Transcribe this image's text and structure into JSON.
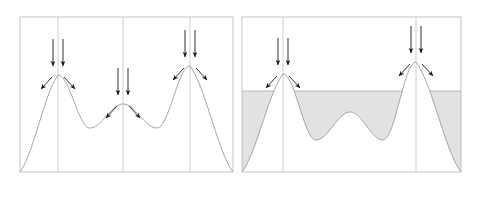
{
  "figure": {
    "title": "",
    "type": "two-panel-schematic",
    "width": 477,
    "height": 199,
    "background_color": "#ffffff"
  },
  "style": {
    "curve_color": "#9a9a9a",
    "curve_width": 0.9,
    "frame_color": "#b4b4b4",
    "frame_width": 0.8,
    "gridline_color": "#c0c0c0",
    "gridline_width": 0.8,
    "arrow_color": "#1a1a1a",
    "arrow_width": 0.9,
    "fill_color": "#e2e2e2",
    "fill_edge_color": "#a8a8a8"
  },
  "panels": [
    {
      "id": "left-panel",
      "name": "unfilled-potential-landscape",
      "frame": {
        "x": 20,
        "y": 17,
        "width": 213,
        "height": 155
      },
      "gridlines_x": [
        58,
        123,
        190
      ],
      "water_level": null,
      "curve": {
        "label": "energy-landscape-curve",
        "peaks": [
          {
            "x": 58,
            "y": 75
          },
          {
            "x": 123,
            "y": 104
          },
          {
            "x": 190,
            "y": 66
          }
        ],
        "valleys": [
          {
            "x": 90,
            "y": 128
          },
          {
            "x": 157,
            "y": 128
          }
        ],
        "endpoints": [
          {
            "x": 20,
            "y": 172
          },
          {
            "x": 233,
            "y": 172
          }
        ]
      },
      "arrow_groups": [
        {
          "name": "arrow-group-peak-1",
          "apex": {
            "x": 58,
            "y": 75
          },
          "down_arrows": [
            {
              "x": 53,
              "y_start": 39,
              "y_end": 66
            },
            {
              "x": 63,
              "y_start": 39,
              "y_end": 66
            }
          ],
          "split_arrows": [
            {
              "x_start": 52,
              "y_start": 77,
              "x_end": 41,
              "y_end": 89
            },
            {
              "x_start": 64,
              "y_start": 77,
              "x_end": 75,
              "y_end": 89
            }
          ]
        },
        {
          "name": "arrow-group-peak-2",
          "apex": {
            "x": 123,
            "y": 104
          },
          "down_arrows": [
            {
              "x": 118,
              "y_start": 68,
              "y_end": 95
            },
            {
              "x": 128,
              "y_start": 68,
              "y_end": 95
            }
          ],
          "split_arrows": [
            {
              "x_start": 117,
              "y_start": 106,
              "x_end": 106,
              "y_end": 118
            },
            {
              "x_start": 129,
              "y_start": 106,
              "x_end": 140,
              "y_end": 118
            }
          ]
        },
        {
          "name": "arrow-group-peak-3",
          "apex": {
            "x": 190,
            "y": 66
          },
          "down_arrows": [
            {
              "x": 185,
              "y_start": 30,
              "y_end": 57
            },
            {
              "x": 195,
              "y_start": 30,
              "y_end": 57
            }
          ],
          "split_arrows": [
            {
              "x_start": 184,
              "y_start": 68,
              "x_end": 173,
              "y_end": 80
            },
            {
              "x_start": 196,
              "y_start": 68,
              "x_end": 207,
              "y_end": 80
            }
          ]
        }
      ]
    },
    {
      "id": "right-panel",
      "name": "filled-potential-landscape",
      "frame": {
        "x": 242,
        "y": 17,
        "width": 219,
        "height": 155
      },
      "gridlines_x": [
        283,
        416
      ],
      "water_level": {
        "y": 91,
        "label": "fill-level-line"
      },
      "curve": {
        "label": "energy-landscape-curve",
        "peaks": [
          {
            "x": 283,
            "y": 74
          },
          {
            "x": 350,
            "y": 112
          },
          {
            "x": 416,
            "y": 62
          }
        ],
        "valleys": [
          {
            "x": 316,
            "y": 140
          },
          {
            "x": 383,
            "y": 140
          }
        ],
        "endpoints": [
          {
            "x": 242,
            "y": 172
          },
          {
            "x": 461,
            "y": 172
          }
        ]
      },
      "arrow_groups": [
        {
          "name": "arrow-group-peak-1",
          "apex": {
            "x": 283,
            "y": 74
          },
          "down_arrows": [
            {
              "x": 278,
              "y_start": 38,
              "y_end": 65
            },
            {
              "x": 288,
              "y_start": 38,
              "y_end": 65
            }
          ],
          "split_arrows": [
            {
              "x_start": 277,
              "y_start": 76,
              "x_end": 266,
              "y_end": 88
            },
            {
              "x_start": 289,
              "y_start": 76,
              "x_end": 300,
              "y_end": 88
            }
          ]
        },
        {
          "name": "arrow-group-peak-3",
          "apex": {
            "x": 416,
            "y": 62
          },
          "down_arrows": [
            {
              "x": 411,
              "y_start": 26,
              "y_end": 53
            },
            {
              "x": 421,
              "y_start": 26,
              "y_end": 53
            }
          ],
          "split_arrows": [
            {
              "x_start": 410,
              "y_start": 64,
              "x_end": 399,
              "y_end": 76
            },
            {
              "x_start": 422,
              "y_start": 64,
              "x_end": 433,
              "y_end": 76
            }
          ]
        }
      ]
    }
  ],
  "chart_data": {
    "type": "line",
    "title": "",
    "xlabel": "",
    "ylabel": "",
    "series": [
      {
        "name": "left-landscape",
        "x": [
          20,
          58,
          90,
          123,
          157,
          190,
          233
        ],
        "y": [
          172,
          75,
          128,
          104,
          128,
          66,
          172
        ]
      },
      {
        "name": "right-landscape",
        "x": [
          242,
          283,
          316,
          350,
          383,
          416,
          461
        ],
        "y": [
          172,
          74,
          140,
          112,
          140,
          62,
          172
        ]
      },
      {
        "name": "fill-level",
        "x": [
          242,
          461
        ],
        "y": [
          91,
          91
        ]
      }
    ],
    "grid": true,
    "legend": "none"
  }
}
